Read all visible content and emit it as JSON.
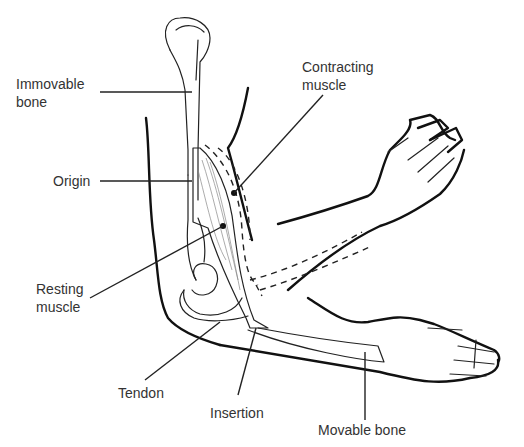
{
  "diagram": {
    "labels": {
      "immovable_bone": "Immovable\nbone",
      "contracting_muscle": "Contracting\nmuscle",
      "origin": "Origin",
      "resting_muscle": "Resting\nmuscle",
      "tendon": "Tendon",
      "insertion": "Insertion",
      "movable_bone": "Movable bone"
    },
    "colors": {
      "line": "#111111",
      "text": "#333333",
      "background": "#ffffff"
    }
  }
}
